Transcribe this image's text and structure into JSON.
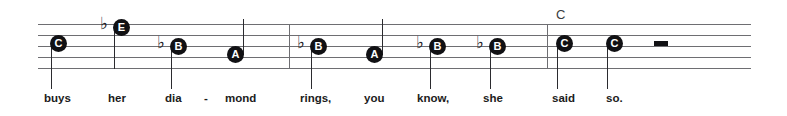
{
  "score": {
    "staff": {
      "left": 38,
      "right": 751,
      "line_tops": [
        24,
        35,
        46,
        57,
        68
      ],
      "line_color": "#6e6e72"
    },
    "barlines": [
      {
        "name": "barline-1",
        "x": 289,
        "top": 24,
        "height": 45
      },
      {
        "name": "barline-2",
        "x": 547,
        "top": 24,
        "height": 45
      }
    ],
    "chord_symbols": [
      {
        "name": "chord-symbol-c",
        "text": "C",
        "x": 556,
        "y": 8
      }
    ],
    "notes": [
      {
        "name": "note-c",
        "letter": "C",
        "accidental": "",
        "head_x": 50,
        "head_y": 35,
        "stem_direction": "down",
        "stem_x": 51,
        "stem_top": 44,
        "stem_height": 45
      },
      {
        "name": "note-e-flat",
        "letter": "E",
        "accidental": "♭",
        "accidental_x": 100,
        "accidental_y": 15,
        "head_x": 113,
        "head_y": 19,
        "stem_direction": "down",
        "stem_x": 114,
        "stem_top": 28,
        "stem_height": 41
      },
      {
        "name": "note-b-flat-1",
        "letter": "B",
        "accidental": "♭",
        "accidental_x": 157,
        "accidental_y": 34,
        "head_x": 170,
        "head_y": 38,
        "stem_direction": "down",
        "stem_x": 171,
        "stem_top": 47,
        "stem_height": 42
      },
      {
        "name": "note-a-1",
        "letter": "A",
        "accidental": "",
        "head_x": 227,
        "head_y": 46,
        "stem_direction": "up",
        "stem_x": 243,
        "stem_top": 19,
        "stem_height": 36
      },
      {
        "name": "note-b-flat-2",
        "letter": "B",
        "accidental": "♭",
        "accidental_x": 297,
        "accidental_y": 34,
        "head_x": 310,
        "head_y": 38,
        "stem_direction": "down",
        "stem_x": 311,
        "stem_top": 47,
        "stem_height": 42
      },
      {
        "name": "note-a-2",
        "letter": "A",
        "accidental": "",
        "head_x": 366,
        "head_y": 46,
        "stem_direction": "up",
        "stem_x": 382,
        "stem_top": 19,
        "stem_height": 36
      },
      {
        "name": "note-b-flat-3",
        "letter": "B",
        "accidental": "♭",
        "accidental_x": 416,
        "accidental_y": 34,
        "head_x": 429,
        "head_y": 38,
        "stem_direction": "down",
        "stem_x": 430,
        "stem_top": 47,
        "stem_height": 42
      },
      {
        "name": "note-b-flat-4",
        "letter": "B",
        "accidental": "♭",
        "accidental_x": 476,
        "accidental_y": 34,
        "head_x": 489,
        "head_y": 38,
        "stem_direction": "down",
        "stem_x": 490,
        "stem_top": 47,
        "stem_height": 42
      },
      {
        "name": "note-c-2",
        "letter": "C",
        "accidental": "",
        "head_x": 556,
        "head_y": 35,
        "stem_direction": "down",
        "stem_x": 557,
        "stem_top": 44,
        "stem_height": 45
      },
      {
        "name": "note-c-3",
        "letter": "C",
        "accidental": "",
        "head_x": 606,
        "head_y": 35,
        "stem_direction": "down",
        "stem_x": 607,
        "stem_top": 44,
        "stem_height": 45
      }
    ],
    "rests": [
      {
        "name": "half-rest",
        "x": 654,
        "y": 41,
        "width": 14,
        "height": 5
      }
    ],
    "lyrics": [
      {
        "name": "lyric-buys",
        "text": "buys",
        "x": 44,
        "y": 93
      },
      {
        "name": "lyric-her",
        "text": "her",
        "x": 108,
        "y": 93
      },
      {
        "name": "lyric-dia",
        "text": "dia",
        "x": 165,
        "y": 93
      },
      {
        "name": "lyric-mond",
        "text": "mond",
        "x": 225,
        "y": 93
      },
      {
        "name": "lyric-rings",
        "text": "rings,",
        "x": 300,
        "y": 93
      },
      {
        "name": "lyric-you",
        "text": "you",
        "x": 364,
        "y": 93
      },
      {
        "name": "lyric-know",
        "text": "know,",
        "x": 417,
        "y": 93
      },
      {
        "name": "lyric-she",
        "text": "she",
        "x": 483,
        "y": 93
      },
      {
        "name": "lyric-said",
        "text": "said",
        "x": 552,
        "y": 93
      },
      {
        "name": "lyric-so",
        "text": "so.",
        "x": 606,
        "y": 93
      }
    ],
    "hyphens": [
      {
        "name": "lyric-hyphen-dia-mond",
        "text": "-",
        "x": 204,
        "y": 93
      }
    ]
  }
}
